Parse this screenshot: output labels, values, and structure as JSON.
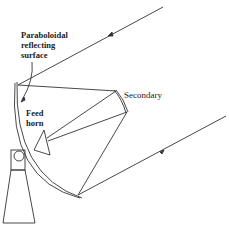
{
  "diagram": {
    "type": "cassegrain-antenna",
    "labels": {
      "primary": [
        "Paraboloidal",
        "reflecting",
        "surface"
      ],
      "feed": [
        "Feed",
        "horn"
      ],
      "secondary": "Secondary"
    },
    "colors": {
      "line": "#333333",
      "background": "#ffffff"
    }
  }
}
